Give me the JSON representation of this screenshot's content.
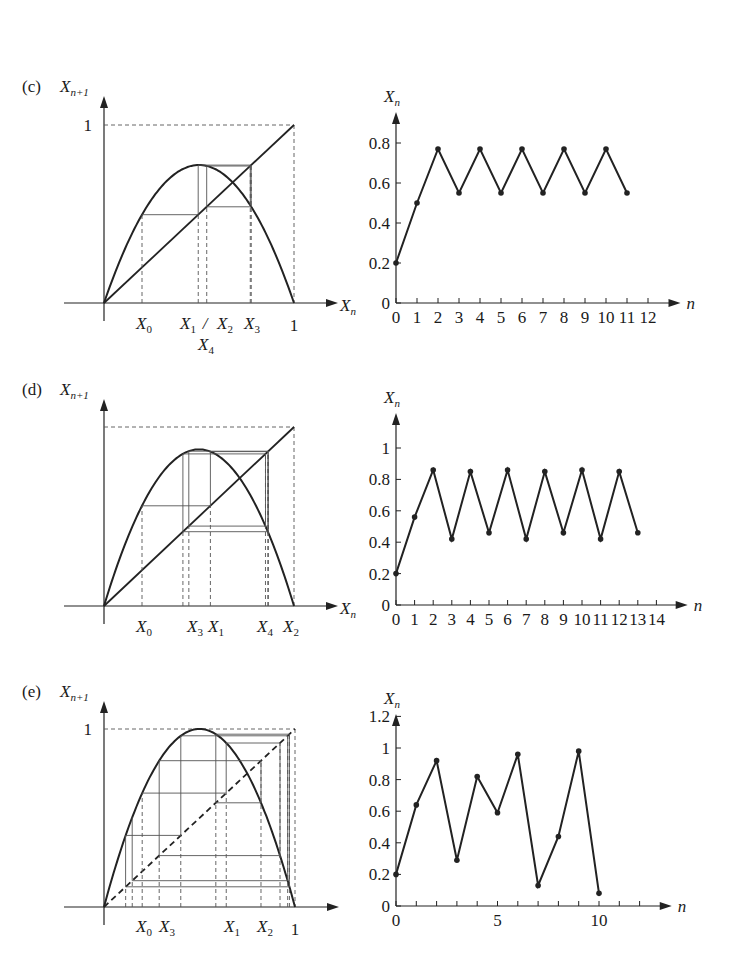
{
  "figure": {
    "panels": [
      {
        "tag": "(c)",
        "cobweb": {
          "ylabel": "X",
          "ylabel_sub": "n+1",
          "xlabel": "X",
          "xlabel_sub": "n",
          "one_label": "1",
          "x_one_label": "1",
          "origin": [
            104,
            303
          ],
          "x1px": 294,
          "y1px": 125,
          "r": 3.1,
          "x0": 0.2,
          "steps": 4,
          "diagonal_dashed": false,
          "x_markers": [
            {
              "label": "X",
              "sub": "0",
              "x": 0.2
            },
            {
              "label": "X",
              "sub": "1",
              "x": 0.496,
              "text": "X1/X2",
              "sublabel_below": "X4"
            },
            {
              "label": "X",
              "sub": "3",
              "x": 0.775
            }
          ]
        }
      },
      {
        "tag": "(d)",
        "cobweb": {
          "ylabel": "X",
          "ylabel_sub": "n+1",
          "xlabel": "X",
          "xlabel_sub": "n",
          "origin": [
            104,
            606
          ],
          "x1px": 294,
          "y1px": 427,
          "r": 3.5,
          "x0": 0.2,
          "steps": 6,
          "diagonal_dashed": false
        }
      },
      {
        "tag": "(e)",
        "cobweb": {
          "ylabel": "X",
          "ylabel_sub": "n+1",
          "xlabel": "",
          "one_label": "1",
          "x_one_label": "1",
          "origin": [
            104,
            907
          ],
          "x1px": 295,
          "y1px": 729,
          "r": 4.0,
          "x0": 0.2,
          "steps": 10,
          "diagonal_dashed": true
        }
      }
    ]
  },
  "chart_data": [
    {
      "type": "line",
      "title": "(c) time series",
      "xlabel": "n",
      "ylabel": "X_n",
      "x": [
        0,
        1,
        2,
        3,
        4,
        5,
        6,
        7,
        8,
        9,
        10,
        11
      ],
      "values": [
        0.2,
        0.5,
        0.77,
        0.55,
        0.77,
        0.55,
        0.77,
        0.55,
        0.77,
        0.55,
        0.77,
        0.55
      ],
      "x_ticks": [
        "0",
        "1",
        "2",
        "3",
        "4",
        "5",
        "6",
        "7",
        "8",
        "9",
        "10",
        "11",
        "12"
      ],
      "y_ticks": [
        "0",
        "0.2",
        "0.4",
        "0.6",
        "0.8"
      ],
      "xlim": [
        0,
        12.5
      ],
      "ylim": [
        0,
        0.9
      ],
      "px": {
        "ox": 396,
        "oy": 303,
        "dx": 21.0,
        "dy": 200.0
      }
    },
    {
      "type": "line",
      "title": "(d) time series",
      "xlabel": "n",
      "ylabel": "X_n",
      "x": [
        0,
        1,
        2,
        3,
        4,
        5,
        6,
        7,
        8,
        9,
        10,
        11,
        12,
        13
      ],
      "values": [
        0.2,
        0.56,
        0.86,
        0.42,
        0.85,
        0.46,
        0.86,
        0.42,
        0.85,
        0.46,
        0.86,
        0.42,
        0.85,
        0.46
      ],
      "x_ticks": [
        "0",
        "1",
        "2",
        "3",
        "4",
        "5",
        "6",
        "7",
        "8",
        "9",
        "10",
        "11",
        "12",
        "13",
        "14"
      ],
      "y_ticks": [
        "0",
        "0.2",
        "0.4",
        "0.6",
        "0.8",
        "1"
      ],
      "xlim": [
        0,
        14.5
      ],
      "ylim": [
        0,
        1.15
      ],
      "px": {
        "ox": 396,
        "oy": 605,
        "dx": 18.6,
        "dy": 157.0
      }
    },
    {
      "type": "line",
      "title": "(e) time series",
      "xlabel": "n",
      "ylabel": "X_n",
      "x": [
        0,
        1,
        2,
        3,
        4,
        5,
        6,
        7,
        8,
        9,
        10
      ],
      "values": [
        0.2,
        0.64,
        0.92,
        0.29,
        0.82,
        0.59,
        0.96,
        0.13,
        0.44,
        0.98,
        0.08
      ],
      "x_ticks": [
        "0",
        "5",
        "10"
      ],
      "x_tick_values": [
        0,
        5,
        10
      ],
      "y_ticks": [
        "0",
        "0.2",
        "0.4",
        "0.6",
        "0.8",
        "1",
        "1.2"
      ],
      "xlim": [
        0,
        12.5
      ],
      "ylim": [
        0,
        1.3
      ],
      "px": {
        "ox": 396,
        "oy": 906,
        "dx": 20.3,
        "dy": 158.0
      }
    }
  ],
  "labels": {
    "c_x0": "X",
    "c_x1x2": "X",
    "c_x3": "X",
    "n": "n"
  }
}
